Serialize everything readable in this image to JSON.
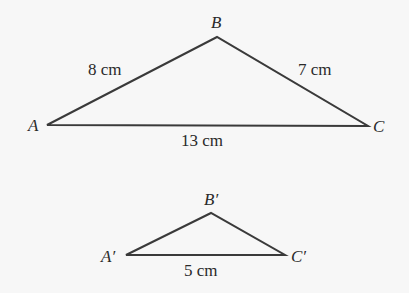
{
  "diagram": {
    "colors": {
      "line": "#3a3a3a",
      "text": "#2a2a2a",
      "background": "#f7f7f7"
    },
    "large_triangle": {
      "vertices": {
        "A": "A",
        "B": "B",
        "C": "C"
      },
      "sides": {
        "AB": "8 cm",
        "BC": "7 cm",
        "AC": "13 cm"
      }
    },
    "small_triangle": {
      "vertices": {
        "A": "A′",
        "B": "B′",
        "C": "C′"
      },
      "sides": {
        "AC": "5 cm"
      }
    }
  }
}
